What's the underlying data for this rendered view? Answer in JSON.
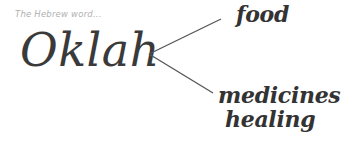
{
  "caption": "The Hebrew word...",
  "word": "Oklah",
  "branches": [
    {
      "label": "food"
    },
    {
      "label": "medicines"
    },
    {
      "label": "healing"
    }
  ],
  "colors": {
    "text": "#333333",
    "caption": "#b0b0b0",
    "lines": "#555555"
  }
}
